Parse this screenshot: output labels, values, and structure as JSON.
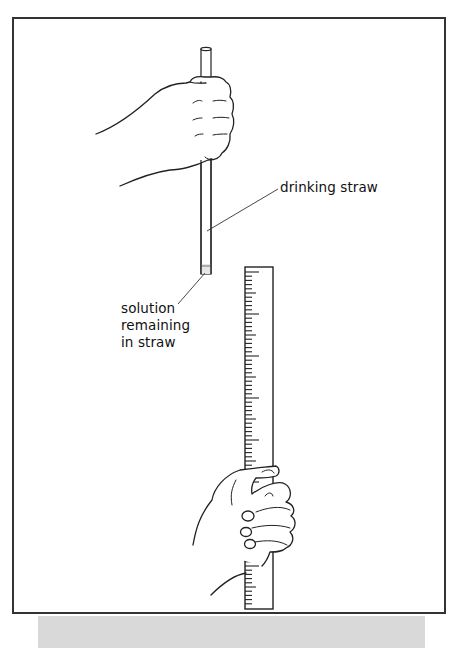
{
  "figure": {
    "labels": {
      "straw": "drinking straw",
      "solution_line1": "solution",
      "solution_line2": "remaining",
      "solution_line3": "in straw"
    },
    "elements": [
      "hand holding drinking straw",
      "drinking straw",
      "solution remaining in straw",
      "ruler",
      "hand holding ruler"
    ],
    "colors": {
      "line": "#222222",
      "frame": "#333333",
      "shadow": "#d9d9d9",
      "solution": "#e6e6e6"
    }
  }
}
